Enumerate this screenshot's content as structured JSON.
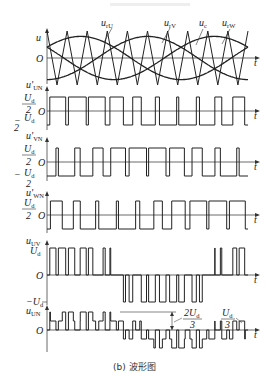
{
  "figure": {
    "caption": "(b) 波形图",
    "top_caption": ""
  },
  "panels": {
    "modulation": {
      "y_label": "u",
      "origin_label": "O",
      "t_label": "t",
      "curves": [
        {
          "name": "u_rU",
          "label_main": "u",
          "label_sub": "rU"
        },
        {
          "name": "u_rV",
          "label_main": "u",
          "label_sub": "rV"
        },
        {
          "name": "u_c",
          "label_main": "u",
          "label_sub": "c"
        },
        {
          "name": "u_rW",
          "label_main": "u",
          "label_sub": "rW"
        }
      ]
    },
    "uUN_prime": {
      "y_label_main": "u'",
      "y_label_sub": "UN",
      "pos_level": "Ud/2",
      "neg_level": "-Ud/2",
      "origin_label": "O",
      "t_label": "t"
    },
    "uVN_prime": {
      "y_label_main": "u'",
      "y_label_sub": "VN",
      "pos_level": "Ud/2",
      "neg_level": "-Ud/2",
      "origin_label": "O",
      "t_label": "t"
    },
    "uWN_prime": {
      "y_label_main": "u'",
      "y_label_sub": "WN",
      "pos_level": "Ud/2",
      "origin_label": "O",
      "t_label": "t"
    },
    "uUV": {
      "y_label_main": "u",
      "y_label_sub": "UV",
      "pos_level": "Ud",
      "neg_level": "-Ud",
      "origin_label": "O",
      "t_label": "t"
    },
    "uUN": {
      "y_label_main": "u",
      "y_label_sub": "UN",
      "origin_label": "O",
      "t_label": "t",
      "annotation_2Ud3": "2Ud/3",
      "annotation_Ud3": "Ud/3"
    }
  },
  "chart_data": [
    {
      "type": "line",
      "title": "SPWM modulation: reference sines vs triangular carrier",
      "xlabel": "t",
      "ylabel": "u",
      "series": [
        {
          "name": "u_rU",
          "shape": "sine",
          "phase_deg": 0,
          "amplitude": 0.8
        },
        {
          "name": "u_rV",
          "shape": "sine",
          "phase_deg": -120,
          "amplitude": 0.8
        },
        {
          "name": "u_rW",
          "shape": "sine",
          "phase_deg": 120,
          "amplitude": 0.8
        },
        {
          "name": "u_c",
          "shape": "triangle",
          "carrier_cycles": 10,
          "amplitude": 1.0
        }
      ]
    },
    {
      "type": "line",
      "title": "u'UN",
      "levels": [
        "Ud/2",
        "-Ud/2"
      ],
      "description": "PWM from comparison of u_rU with u_c"
    },
    {
      "type": "line",
      "title": "u'VN",
      "levels": [
        "Ud/2",
        "-Ud/2"
      ],
      "description": "PWM from comparison of u_rV with u_c"
    },
    {
      "type": "line",
      "title": "u'WN",
      "levels": [
        "Ud/2",
        "-Ud/2"
      ],
      "description": "PWM from comparison of u_rW with u_c"
    },
    {
      "type": "line",
      "title": "uUV",
      "levels": [
        "Ud",
        "0",
        "-Ud"
      ],
      "description": "u'UN - u'VN"
    },
    {
      "type": "line",
      "title": "uUN",
      "levels": [
        "2Ud/3",
        "Ud/3",
        "0",
        "-Ud/3",
        "-2Ud/3"
      ],
      "description": "u'UN - (u'UN+u'VN+u'WN)/3"
    }
  ],
  "render": {
    "x0": 47,
    "x1": 248,
    "axis_end": 258,
    "carrier_cycles": 10,
    "mod_index": 0.8,
    "panel_mod": {
      "zero": 58,
      "amp": 27
    },
    "panel_u": {
      "zero": 111,
      "half": 14
    },
    "panel_v": {
      "zero": 162,
      "half": 14
    },
    "panel_w": {
      "zero": 215,
      "half": 14
    },
    "panel_uv": {
      "zero": 275,
      "full": 27
    },
    "panel_un": {
      "zero": 330,
      "unit": 9
    }
  }
}
